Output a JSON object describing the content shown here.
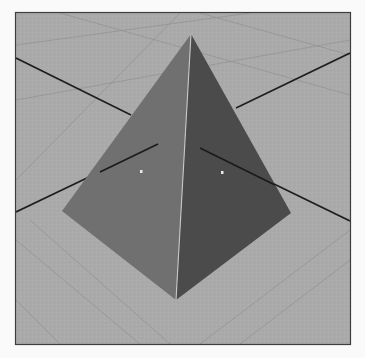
{
  "scene": {
    "description": "3D rendered pyramid on a gray ground plane grid with two dark axis lines",
    "colors": {
      "page_background": "#fafafa",
      "ground": "#a9a9a9",
      "frame": "#4a4a4a",
      "grid_line": "#8e8e8e",
      "axis_line": "#1e1e1e",
      "face_left": "#6f6f6f",
      "face_right": "#4a4a4a",
      "ridge_edge": "#c8c8c8",
      "marker": "#e8e8e8"
    },
    "frame": {
      "x": 15,
      "y": 12,
      "width": 336,
      "height": 333
    },
    "pyramid": {
      "apex": [
        191,
        34
      ],
      "base_left": [
        62,
        211
      ],
      "base_bottom": [
        176,
        300
      ],
      "base_right": [
        291,
        213
      ]
    },
    "markers": [
      {
        "name": "left-face-marker",
        "x": 141,
        "y": 171
      },
      {
        "name": "right-face-marker",
        "x": 222,
        "y": 172
      }
    ]
  }
}
